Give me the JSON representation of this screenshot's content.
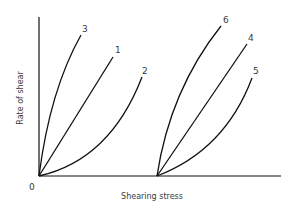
{
  "diagram": {
    "x_axis_label": "Shearing stress",
    "y_axis_label": "Rate of shear",
    "origin_label": "0",
    "left_group": {
      "curves": [
        {
          "id": "3",
          "label": "3",
          "shape": "concave-down (shear-thinning)"
        },
        {
          "id": "1",
          "label": "1",
          "shape": "linear (Newtonian)"
        },
        {
          "id": "2",
          "label": "2",
          "shape": "concave-up (shear-thickening)"
        }
      ]
    },
    "right_group": {
      "note": "curves start from a yield stress offset on the shearing stress axis",
      "curves": [
        {
          "id": "6",
          "label": "6",
          "shape": "concave-down with yield stress"
        },
        {
          "id": "4",
          "label": "4",
          "shape": "linear with yield stress (Bingham)"
        },
        {
          "id": "5",
          "label": "5",
          "shape": "concave-up with yield stress"
        }
      ]
    },
    "colors": {
      "line": "#111111",
      "text": "#3a3a3a",
      "background": "#ffffff"
    }
  }
}
